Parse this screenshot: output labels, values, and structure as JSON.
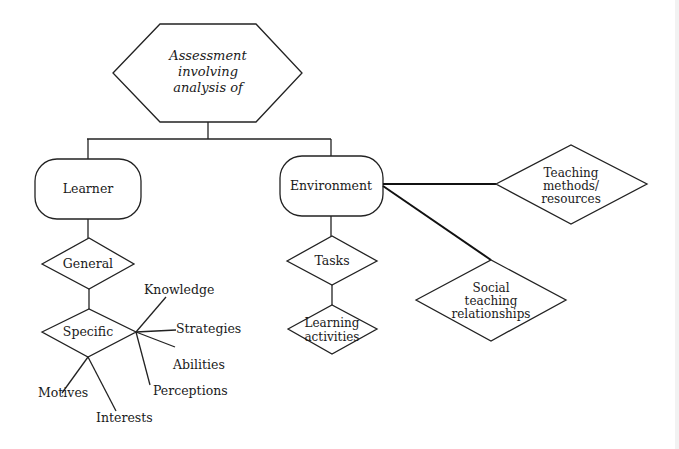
{
  "diagram": {
    "root": {
      "lines": [
        "Assessment",
        "involving",
        "analysis of"
      ]
    },
    "learner": {
      "label": "Learner"
    },
    "environment": {
      "label": "Environment"
    },
    "general": {
      "label": "General"
    },
    "specific": {
      "label": "Specific"
    },
    "specific_aspects": {
      "knowledge": "Knowledge",
      "strategies": "Strategies",
      "abilities": "Abilities",
      "perceptions": "Perceptions",
      "motives": "Motives",
      "interests": "Interests"
    },
    "tasks": {
      "label": "Tasks"
    },
    "learning_activities": {
      "lines": [
        "Learning",
        "activities"
      ]
    },
    "teaching_methods": {
      "lines": [
        "Teaching",
        "methods/",
        "resources"
      ]
    },
    "social_teaching": {
      "lines": [
        "Social",
        "teaching",
        "relationships"
      ]
    }
  },
  "colors": {
    "stroke": "#222222",
    "background": "#ffffff",
    "text": "#1a1a1a"
  }
}
